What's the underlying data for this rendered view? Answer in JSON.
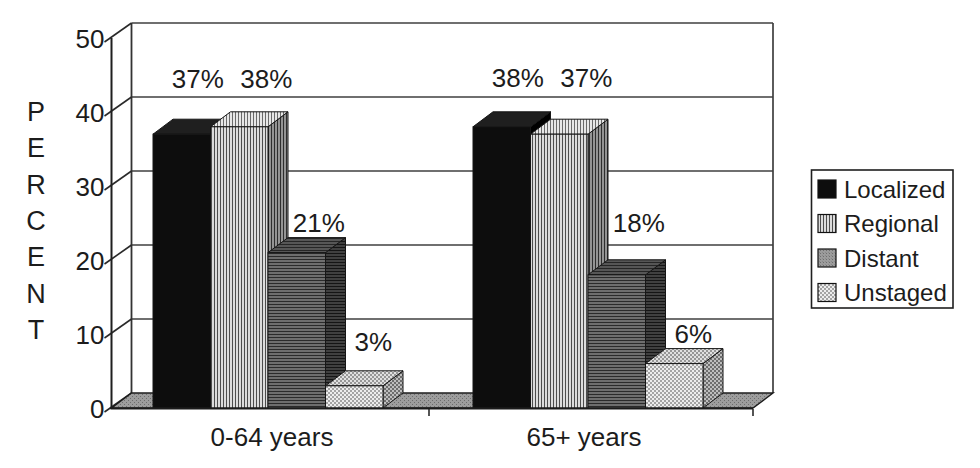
{
  "chart_data": {
    "type": "bar",
    "style": "3d-clustered-column",
    "title": "",
    "categories": [
      "0-64 years",
      "65+ years"
    ],
    "series": [
      {
        "name": "Localized",
        "values": [
          37,
          38
        ],
        "labels": [
          "37%",
          "38%"
        ],
        "pattern": "solid-black"
      },
      {
        "name": "Regional",
        "values": [
          38,
          37
        ],
        "labels": [
          "38%",
          "37%"
        ],
        "pattern": "vertical-stripes"
      },
      {
        "name": "Distant",
        "values": [
          21,
          18
        ],
        "labels": [
          "21%",
          "18%"
        ],
        "pattern": "dark-gray-horizontal-stripes"
      },
      {
        "name": "Unstaged",
        "values": [
          3,
          6
        ],
        "labels": [
          "3%",
          "6%"
        ],
        "pattern": "light-checker"
      }
    ],
    "ylabel": "PERCENT",
    "ylabel_orientation": "stacked-letters",
    "yticks": [
      0,
      10,
      20,
      30,
      40,
      50
    ],
    "ylim": [
      0,
      50
    ],
    "grid": true,
    "legend_position": "right",
    "legend_entries": [
      "Localized",
      "Regional",
      "Distant",
      "Unstaged"
    ],
    "colors": {
      "ink": "#1c1c1c",
      "background": "#ffffff",
      "gridline": "#3f3f3f",
      "floor_gray": "#929292",
      "localized_black": "#0d0d0d",
      "regional_light": "#dcdcdc",
      "distant_gray": "#6e6e6e",
      "unstaged_light": "#ededed"
    }
  }
}
